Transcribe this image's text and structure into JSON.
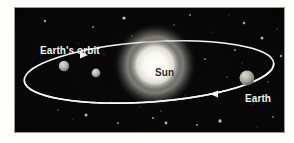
{
  "figure": {
    "name": "earth-orbit-around-sun-diagram",
    "caption_labels": {
      "orbit": "Earth's orbit",
      "sun": "Sun",
      "earth": "Earth"
    },
    "colors": {
      "background": "#ffffff",
      "space": "#070708",
      "orbit_line": "#f5f5f2",
      "sun_core": "#ffffff",
      "sun_glow": "#e8e8e0",
      "planet_gray": "#b9b9b4",
      "label_light": "#f2f2f0",
      "label_dark": "#2b2b2b"
    },
    "panel": {
      "x": 14,
      "y": 7,
      "width": 271,
      "height": 126
    }
  },
  "chart_data": {
    "type": "scatter",
    "title": "Earth's orbit",
    "xlabel": "",
    "ylabel": "",
    "xlim": [
      0,
      271
    ],
    "ylim": [
      0,
      126
    ],
    "grid": false,
    "legend": "none",
    "annotations": [
      {
        "text": "Earth's orbit",
        "x": 26,
        "y": 38,
        "color": "#f2f2f0"
      },
      {
        "text": "Sun",
        "x": 141,
        "y": 60,
        "color": "#2b2b2b"
      },
      {
        "text": "Earth",
        "x": 231,
        "y": 86,
        "color": "#f2f2f0"
      }
    ],
    "orbit_ellipse": {
      "cx": 135,
      "cy": 65,
      "rx": 125,
      "ry": 30,
      "rotation_deg": -4,
      "stroke": "#f5f5f2",
      "stroke_width": 1.6
    },
    "direction_arrows": [
      {
        "name": "upper-arrow",
        "x": 74,
        "y": 48,
        "direction": "right"
      },
      {
        "name": "lower-arrow",
        "x": 196,
        "y": 87,
        "direction": "left"
      }
    ],
    "bodies": [
      {
        "name": "Sun",
        "cx": 141,
        "cy": 58,
        "r": 27,
        "fill": "#f4f4ee",
        "label": "Sun"
      },
      {
        "name": "Earth",
        "cx": 233,
        "cy": 71,
        "r": 7.5,
        "fill": "#b9b9b4",
        "label": "Earth"
      },
      {
        "name": "planet-a",
        "cx": 50,
        "cy": 59,
        "r": 5.2,
        "fill": "#bdbdb8",
        "label": ""
      },
      {
        "name": "planet-b",
        "cx": 82,
        "cy": 66,
        "r": 4.4,
        "fill": "#b5b5b0",
        "label": ""
      }
    ],
    "stars": [
      {
        "x": 18,
        "y": 61,
        "r": 0.7,
        "b": 0.55
      },
      {
        "x": 31,
        "y": 14,
        "r": 1.2,
        "b": 0.95
      },
      {
        "x": 44,
        "y": 103,
        "r": 0.8,
        "b": 0.6
      },
      {
        "x": 59,
        "y": 112,
        "r": 0.6,
        "b": 0.45
      },
      {
        "x": 72,
        "y": 108,
        "r": 1.5,
        "b": 0.95
      },
      {
        "x": 79,
        "y": 20,
        "r": 1.0,
        "b": 0.7
      },
      {
        "x": 90,
        "y": 47,
        "r": 0.6,
        "b": 0.5
      },
      {
        "x": 97,
        "y": 94,
        "r": 0.5,
        "b": 0.4
      },
      {
        "x": 104,
        "y": 116,
        "r": 1.0,
        "b": 0.75
      },
      {
        "x": 110,
        "y": 11,
        "r": 1.6,
        "b": 1.0
      },
      {
        "x": 118,
        "y": 29,
        "r": 0.7,
        "b": 0.55
      },
      {
        "x": 126,
        "y": 100,
        "r": 0.6,
        "b": 0.45
      },
      {
        "x": 139,
        "y": 111,
        "r": 1.1,
        "b": 0.8
      },
      {
        "x": 147,
        "y": 104,
        "r": 0.7,
        "b": 0.55
      },
      {
        "x": 152,
        "y": 116,
        "r": 1.4,
        "b": 0.95
      },
      {
        "x": 160,
        "y": 18,
        "r": 0.8,
        "b": 0.6
      },
      {
        "x": 168,
        "y": 37,
        "r": 0.6,
        "b": 0.45
      },
      {
        "x": 176,
        "y": 8,
        "r": 1.0,
        "b": 0.7
      },
      {
        "x": 183,
        "y": 118,
        "r": 1.1,
        "b": 0.8
      },
      {
        "x": 191,
        "y": 52,
        "r": 0.9,
        "b": 0.65
      },
      {
        "x": 199,
        "y": 25,
        "r": 0.6,
        "b": 0.45
      },
      {
        "x": 206,
        "y": 114,
        "r": 1.7,
        "b": 1.0
      },
      {
        "x": 213,
        "y": 70,
        "r": 0.7,
        "b": 0.5
      },
      {
        "x": 221,
        "y": 43,
        "r": 1.0,
        "b": 0.7
      },
      {
        "x": 228,
        "y": 56,
        "r": 0.6,
        "b": 0.45
      },
      {
        "x": 230,
        "y": 16,
        "r": 1.3,
        "b": 0.9
      },
      {
        "x": 239,
        "y": 97,
        "r": 0.6,
        "b": 0.45
      },
      {
        "x": 248,
        "y": 31,
        "r": 1.5,
        "b": 0.95
      },
      {
        "x": 254,
        "y": 75,
        "r": 0.8,
        "b": 0.6
      },
      {
        "x": 259,
        "y": 110,
        "r": 1.0,
        "b": 0.75
      },
      {
        "x": 263,
        "y": 22,
        "r": 0.7,
        "b": 0.5
      },
      {
        "x": 267,
        "y": 49,
        "r": 1.2,
        "b": 0.85
      },
      {
        "x": 36,
        "y": 86,
        "r": 0.5,
        "b": 0.4
      },
      {
        "x": 64,
        "y": 36,
        "r": 0.5,
        "b": 0.4
      },
      {
        "x": 123,
        "y": 55,
        "r": 0.5,
        "b": 0.4
      },
      {
        "x": 171,
        "y": 88,
        "r": 0.5,
        "b": 0.4
      },
      {
        "x": 215,
        "y": 8,
        "r": 0.6,
        "b": 0.5
      },
      {
        "x": 243,
        "y": 120,
        "r": 0.6,
        "b": 0.45
      }
    ]
  }
}
